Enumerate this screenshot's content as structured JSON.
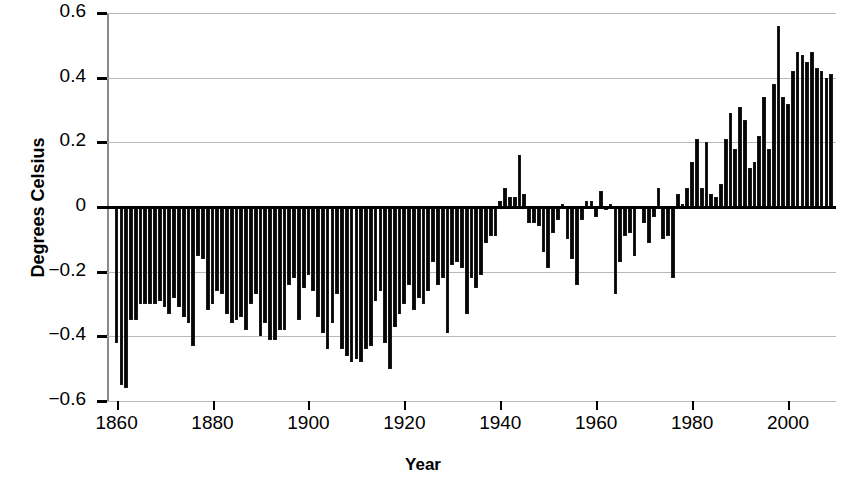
{
  "chart_data": {
    "type": "bar",
    "title": "",
    "xlabel": "Year",
    "ylabel": "Degrees Celsius",
    "xlim": [
      1858,
      2010
    ],
    "ylim": [
      -0.6,
      0.6
    ],
    "grid": true,
    "legend": null,
    "xticks": [
      1860,
      1880,
      1900,
      1920,
      1940,
      1960,
      1980,
      2000
    ],
    "xtick_labels": [
      "1860",
      "1880",
      "1900",
      "1920",
      "1940",
      "1960",
      "1980",
      "2000"
    ],
    "yticks": [
      -0.6,
      -0.4,
      -0.2,
      0,
      0.2,
      0.4,
      0.6
    ],
    "ytick_labels": [
      "−0.6",
      "−0.4",
      "−0.2",
      "0",
      "0.2",
      "0.4",
      "0.6"
    ],
    "bar_color": "#4a4a4a",
    "x": [
      1860,
      1861,
      1862,
      1863,
      1864,
      1865,
      1866,
      1867,
      1868,
      1869,
      1870,
      1871,
      1872,
      1873,
      1874,
      1875,
      1876,
      1877,
      1878,
      1879,
      1880,
      1881,
      1882,
      1883,
      1884,
      1885,
      1886,
      1887,
      1888,
      1889,
      1890,
      1891,
      1892,
      1893,
      1894,
      1895,
      1896,
      1897,
      1898,
      1899,
      1900,
      1901,
      1902,
      1903,
      1904,
      1905,
      1906,
      1907,
      1908,
      1909,
      1910,
      1911,
      1912,
      1913,
      1914,
      1915,
      1916,
      1917,
      1918,
      1919,
      1920,
      1921,
      1922,
      1923,
      1924,
      1925,
      1926,
      1927,
      1928,
      1929,
      1930,
      1931,
      1932,
      1933,
      1934,
      1935,
      1936,
      1937,
      1938,
      1939,
      1940,
      1941,
      1942,
      1943,
      1944,
      1945,
      1946,
      1947,
      1948,
      1949,
      1950,
      1951,
      1952,
      1953,
      1954,
      1955,
      1956,
      1957,
      1958,
      1959,
      1960,
      1961,
      1962,
      1963,
      1964,
      1965,
      1966,
      1967,
      1968,
      1969,
      1970,
      1971,
      1972,
      1973,
      1974,
      1975,
      1976,
      1977,
      1978,
      1979,
      1980,
      1981,
      1982,
      1983,
      1984,
      1985,
      1986,
      1987,
      1988,
      1989,
      1990,
      1991,
      1992,
      1993,
      1994,
      1995,
      1996,
      1997,
      1998,
      1999,
      2000,
      2001,
      2002,
      2003,
      2004,
      2005,
      2006,
      2007,
      2008,
      2009
    ],
    "values": [
      -0.42,
      -0.55,
      -0.56,
      -0.35,
      -0.35,
      -0.3,
      -0.3,
      -0.3,
      -0.3,
      -0.29,
      -0.31,
      -0.33,
      -0.28,
      -0.31,
      -0.34,
      -0.36,
      -0.43,
      -0.15,
      -0.16,
      -0.32,
      -0.3,
      -0.26,
      -0.27,
      -0.33,
      -0.36,
      -0.35,
      -0.34,
      -0.38,
      -0.3,
      -0.27,
      -0.4,
      -0.36,
      -0.41,
      -0.41,
      -0.38,
      -0.38,
      -0.24,
      -0.22,
      -0.35,
      -0.25,
      -0.21,
      -0.26,
      -0.34,
      -0.39,
      -0.44,
      -0.36,
      -0.27,
      -0.44,
      -0.46,
      -0.48,
      -0.47,
      -0.48,
      -0.44,
      -0.43,
      -0.29,
      -0.26,
      -0.42,
      -0.5,
      -0.37,
      -0.33,
      -0.3,
      -0.24,
      -0.32,
      -0.28,
      -0.3,
      -0.26,
      -0.17,
      -0.24,
      -0.22,
      -0.39,
      -0.18,
      -0.17,
      -0.19,
      -0.33,
      -0.22,
      -0.25,
      -0.21,
      -0.11,
      -0.09,
      -0.09,
      0.02,
      0.06,
      0.03,
      0.03,
      0.16,
      0.04,
      -0.05,
      -0.05,
      -0.06,
      -0.14,
      -0.19,
      -0.08,
      -0.04,
      0.01,
      -0.1,
      -0.16,
      -0.24,
      -0.04,
      0.02,
      0.02,
      -0.03,
      0.05,
      -0.01,
      0.01,
      -0.27,
      -0.17,
      -0.09,
      -0.08,
      -0.15,
      0.0,
      -0.05,
      -0.11,
      -0.03,
      0.06,
      -0.1,
      -0.09,
      -0.22,
      0.04,
      0.01,
      0.06,
      0.14,
      0.21,
      0.06,
      0.2,
      0.04,
      0.03,
      0.07,
      0.21,
      0.29,
      0.18,
      0.31,
      0.27,
      0.12,
      0.14,
      0.22,
      0.34,
      0.18,
      0.38,
      0.56,
      0.34,
      0.32,
      0.42,
      0.48,
      0.47,
      0.45,
      0.48,
      0.43,
      0.42,
      0.4,
      0.41
    ]
  },
  "axis": {
    "y_title": "Degrees Celsius",
    "x_title": "Year"
  }
}
